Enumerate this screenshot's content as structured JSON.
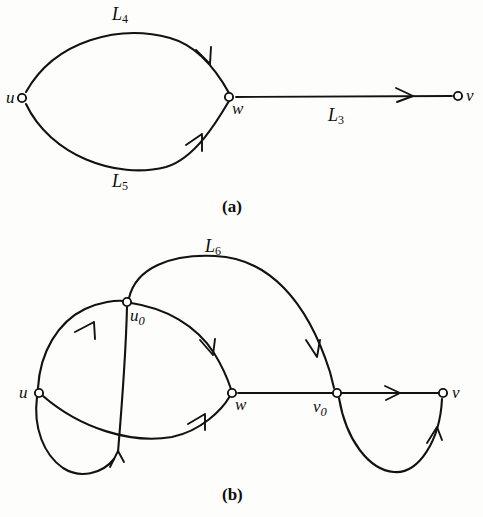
{
  "figure": {
    "ink_color": "#121212",
    "background": "#fdfdfc",
    "panels": [
      {
        "id": "a",
        "caption": "(a)",
        "caption_pos": {
          "x": 229,
          "y": 205
        },
        "nodes": [
          {
            "name": "u",
            "label": "u",
            "sub": "",
            "x": 22,
            "y": 98,
            "label_x": 6,
            "label_y": 90
          },
          {
            "name": "w",
            "label": "w",
            "sub": "",
            "x": 229,
            "y": 97,
            "label_x": 232,
            "label_y": 101
          },
          {
            "name": "v",
            "label": "v",
            "sub": "",
            "x": 458,
            "y": 96,
            "label_x": 466,
            "label_y": 88
          }
        ],
        "edges": [
          {
            "name": "L4",
            "label": "L",
            "sub": "4",
            "from": "u",
            "to": "w",
            "label_x": 112,
            "label_y": 6,
            "shape": "arc-upper"
          },
          {
            "name": "L5",
            "label": "L",
            "sub": "5",
            "from": "u",
            "to": "w",
            "label_x": 112,
            "label_y": 172,
            "shape": "arc-lower"
          },
          {
            "name": "L3",
            "label": "L",
            "sub": "3",
            "from": "w",
            "to": "v",
            "label_x": 328,
            "label_y": 106,
            "shape": "straight"
          }
        ]
      },
      {
        "id": "b",
        "caption": "(b)",
        "caption_pos": {
          "x": 229,
          "y": 492
        },
        "nodes": [
          {
            "name": "u",
            "label": "u",
            "sub": "",
            "x": 39,
            "y": 393,
            "label_x": 20,
            "label_y": 385
          },
          {
            "name": "u0",
            "label": "u",
            "sub": "0",
            "x": 127,
            "y": 302,
            "label_x": 130,
            "label_y": 308
          },
          {
            "name": "w",
            "label": "w",
            "sub": "",
            "x": 232,
            "y": 393,
            "label_x": 235,
            "label_y": 397
          },
          {
            "name": "v0",
            "label": "v",
            "sub": "0",
            "x": 337,
            "y": 393,
            "label_x": 314,
            "label_y": 398
          },
          {
            "name": "v",
            "label": "v",
            "sub": "",
            "x": 443,
            "y": 393,
            "label_x": 452,
            "label_y": 385
          }
        ],
        "edges": [
          {
            "name": "L6",
            "label": "L",
            "sub": "6",
            "from": "u0",
            "to": "v0",
            "label_x": 208,
            "label_y": 238,
            "shape": "arc-top"
          },
          {
            "name": "u-to-u0",
            "label": "",
            "sub": "",
            "from": "u",
            "to": "u0",
            "shape": "arc-left"
          },
          {
            "name": "u0-to-w",
            "label": "",
            "sub": "",
            "from": "u0",
            "to": "w",
            "shape": "arc-right"
          },
          {
            "name": "u-loop-to-u0",
            "label": "",
            "sub": "",
            "from": "u",
            "to": "u0",
            "shape": "lower-loop"
          },
          {
            "name": "w-lower-arc",
            "label": "",
            "sub": "",
            "from": "lower",
            "to": "w",
            "shape": "arc-lower-right"
          },
          {
            "name": "w-to-v0",
            "label": "",
            "sub": "",
            "from": "w",
            "to": "v0",
            "shape": "straight"
          },
          {
            "name": "v0-to-v",
            "label": "",
            "sub": "",
            "from": "v0",
            "to": "v",
            "shape": "straight"
          },
          {
            "name": "v0-loop-to-v",
            "label": "",
            "sub": "",
            "from": "v0",
            "to": "v",
            "shape": "u-loop"
          }
        ]
      }
    ]
  }
}
